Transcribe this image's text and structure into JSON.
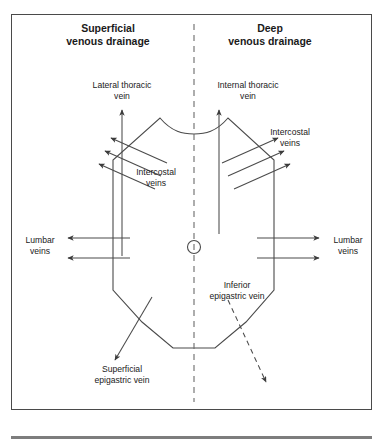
{
  "figure": {
    "title_left": "Superficial\nvenous drainage",
    "title_right": "Deep\nvenous drainage",
    "headings": [
      {
        "id": "superficial",
        "line1": "Superficial",
        "line2": "venous drainage",
        "x": 108,
        "y": 32
      },
      {
        "id": "deep",
        "line1": "Deep",
        "line2": "venous drainage",
        "x": 270,
        "y": 32
      }
    ],
    "labels": [
      {
        "id": "lateral-thoracic-vein",
        "line1": "Lateral thoracic",
        "line2": "vein",
        "x": 122,
        "y": 88
      },
      {
        "id": "internal-thoracic-vein",
        "line1": "Internal thoracic",
        "line2": "vein",
        "x": 248,
        "y": 88
      },
      {
        "id": "intercostal-veins-left",
        "line1": "Intercostal",
        "line2": "veins",
        "x": 156,
        "y": 175
      },
      {
        "id": "intercostal-veins-right",
        "line1": "Intercostal",
        "line2": "veins",
        "x": 290,
        "y": 135
      },
      {
        "id": "lumbar-veins-left",
        "line1": "Lumbar",
        "line2": "veins",
        "x": 40,
        "y": 243
      },
      {
        "id": "lumbar-veins-right",
        "line1": "Lumbar",
        "line2": "veins",
        "x": 348,
        "y": 243
      },
      {
        "id": "inferior-epigastric-vein",
        "line1": "Inferior",
        "line2": "epigastric vein",
        "x": 237,
        "y": 288
      },
      {
        "id": "superficial-epigastric-vein",
        "line1": "Superficial",
        "line2": "epigastric vein",
        "x": 122,
        "y": 372
      }
    ],
    "colors": {
      "frame": "#4a4a4a",
      "stroke": "#4a4a4a",
      "midline": "#6b6b6b",
      "bottom_rule": "#7d7d7d",
      "text": "#1a1a1a",
      "background": "#ffffff"
    },
    "midline_label": "midline-divider",
    "umbilicus_label": "umbilicus",
    "torso_label": "torso-outline"
  }
}
